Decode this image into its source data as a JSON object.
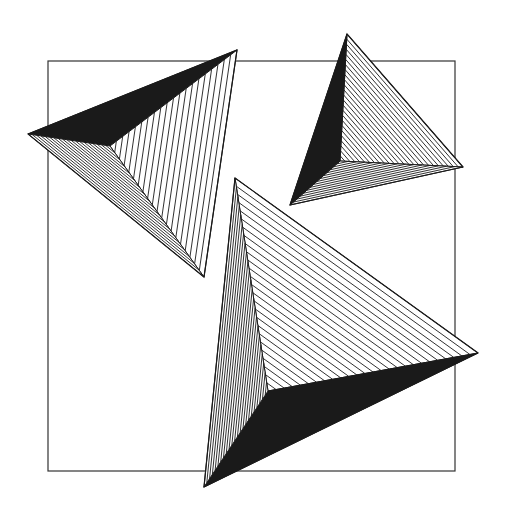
{
  "artwork": {
    "description": "Geometric line art: three triangular pyramids with hatched and solid faces over a square frame",
    "background": "#ffffff",
    "ink": "#1a1a1a",
    "frame": {
      "x1": 48,
      "y1": 61,
      "x2": 455,
      "y2": 471
    },
    "pyramids": [
      {
        "name": "pyramid-top-left",
        "vertices": [
          [
            28,
            134
          ],
          [
            237,
            50
          ],
          [
            204,
            277
          ]
        ],
        "apex": [
          110,
          146
        ],
        "faces": [
          {
            "edge": [
              0,
              1
            ],
            "style": "solid"
          },
          {
            "edge": [
              1,
              2
            ],
            "style": "hatch",
            "spacing": 5.5
          },
          {
            "edge": [
              2,
              0
            ],
            "style": "hatch",
            "spacing": 2.2
          }
        ]
      },
      {
        "name": "pyramid-top-right",
        "vertices": [
          [
            347,
            34
          ],
          [
            463,
            167
          ],
          [
            290,
            205
          ]
        ],
        "apex": [
          340,
          161
        ],
        "faces": [
          {
            "edge": [
              0,
              1
            ],
            "style": "hatch",
            "spacing": 3.5
          },
          {
            "edge": [
              1,
              2
            ],
            "style": "hatch",
            "spacing": 2.2
          },
          {
            "edge": [
              2,
              0
            ],
            "style": "solid"
          }
        ]
      },
      {
        "name": "pyramid-bottom",
        "vertices": [
          [
            235,
            178
          ],
          [
            478,
            353
          ],
          [
            204,
            487
          ]
        ],
        "apex": [
          268,
          391
        ],
        "faces": [
          {
            "edge": [
              0,
              1
            ],
            "style": "hatch",
            "spacing": 6
          },
          {
            "edge": [
              1,
              2
            ],
            "style": "solid"
          },
          {
            "edge": [
              2,
              0
            ],
            "style": "hatch",
            "spacing": 2.4
          }
        ]
      }
    ]
  }
}
